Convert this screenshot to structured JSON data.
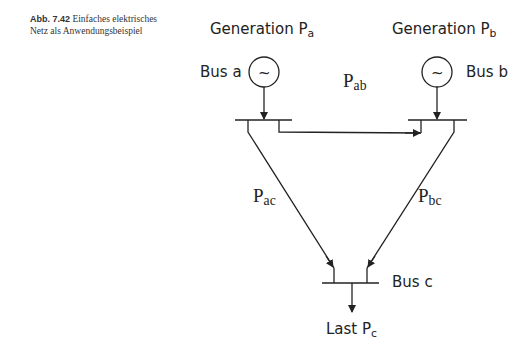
{
  "caption": {
    "number": "Abb. 7.42",
    "text": "Einfaches elektrisches Netz als Anwendungsbeispiel"
  },
  "diagram": {
    "generation_a": {
      "label": "Generation P",
      "sub": "a"
    },
    "generation_b": {
      "label": "Generation P",
      "sub": "b"
    },
    "bus_a": "Bus a",
    "bus_b": "Bus b",
    "bus_c": "Bus c",
    "p_ab": {
      "base": "P",
      "sub": "ab"
    },
    "p_ac": {
      "base": "P",
      "sub": "ac"
    },
    "p_bc": {
      "base": "P",
      "sub": "bc"
    },
    "load_c": {
      "label": "Last P",
      "sub": "c"
    },
    "generator_symbol": "~"
  }
}
